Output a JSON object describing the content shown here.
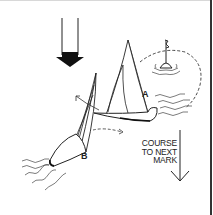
{
  "diagram": {
    "labels": {
      "boat_a": "A",
      "boat_b": "B",
      "course_lines": [
        "COURSE",
        "TO NEXT",
        "MARK"
      ]
    },
    "icons": {
      "wind": "wind-direction-arrow",
      "course": "course-arrow",
      "mark": "buoy-mark"
    },
    "colors": {
      "ink": "#222222",
      "background": "#ffffff",
      "border": "#333333"
    }
  }
}
